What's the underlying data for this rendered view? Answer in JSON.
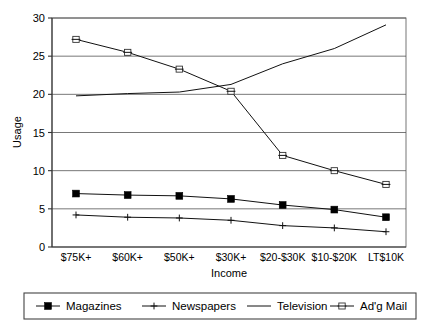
{
  "chart_data": {
    "type": "line",
    "title": "",
    "xlabel": "Income",
    "ylabel": "Usage",
    "ylim": [
      0,
      30
    ],
    "yticks": [
      0,
      5,
      10,
      15,
      20,
      25,
      30
    ],
    "ytick_labels": [
      "0",
      "5",
      "10",
      "15",
      "20",
      "25",
      "30"
    ],
    "grid": true,
    "legend_position": "bottom",
    "categories": [
      "$75K+",
      "$60K+",
      "$50K+",
      "$30K+",
      "$20-$30K",
      "$10-$20K",
      "LT$10K"
    ],
    "series": [
      {
        "name": "Magazines",
        "marker": "filled-square",
        "values": [
          7.0,
          6.8,
          6.7,
          6.3,
          5.5,
          4.9,
          3.9
        ]
      },
      {
        "name": "Newspapers",
        "marker": "plus",
        "values": [
          4.2,
          3.9,
          3.8,
          3.5,
          2.8,
          2.5,
          2.0
        ]
      },
      {
        "name": "Television",
        "marker": "none",
        "values": [
          19.8,
          20.1,
          20.3,
          21.3,
          24.0,
          26.0,
          29.1
        ]
      },
      {
        "name": "Ad'g Mail",
        "marker": "open-bar",
        "values": [
          27.2,
          25.5,
          23.3,
          20.4,
          12.0,
          10.0,
          8.2
        ]
      }
    ]
  },
  "legend": {
    "entries": [
      {
        "label": "Magazines"
      },
      {
        "label": "Newspapers"
      },
      {
        "label": "Television"
      },
      {
        "label": "Ad'g Mail"
      }
    ]
  }
}
